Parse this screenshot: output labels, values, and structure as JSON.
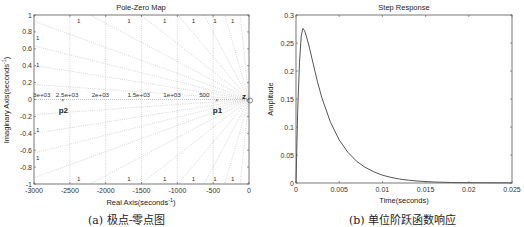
{
  "chart_data": [
    {
      "type": "scatter",
      "title": "Pole-Zero Map",
      "xlabel": "Real Axis(seconds",
      "xlabel_sup": "-1",
      "xlabel_close": ")",
      "ylabel": "Imaginary Axis(seconds",
      "ylabel_sup": "-1",
      "ylabel_close": ")",
      "xlim": [
        -3000,
        0
      ],
      "ylim": [
        -1,
        1
      ],
      "xticks": [
        -3000,
        -2500,
        -2000,
        -1500,
        -1000,
        -500,
        0
      ],
      "yticks": [
        -1,
        -0.8,
        -0.6,
        -0.4,
        -0.2,
        0,
        0.2,
        0.4,
        0.6,
        0.8,
        1
      ],
      "grid": true,
      "grid_freq_labels": [
        "3e+03",
        "2.5e+03",
        "2e+03",
        "1.5e+03",
        "1e+03",
        "500"
      ],
      "damping_label": "1",
      "poles": [
        {
          "label": "p1",
          "real": -450,
          "imag": 0
        },
        {
          "label": "p2",
          "real": -2600,
          "imag": 0
        }
      ],
      "zeros": [
        {
          "label": "z",
          "real": 0,
          "imag": 0
        }
      ],
      "caption": "(a) 极点-零点图"
    },
    {
      "type": "line",
      "title": "Step Response",
      "xlabel": "Time(seconds)",
      "ylabel": "Amplitude",
      "xlim": [
        0,
        0.025
      ],
      "ylim": [
        0,
        0.3
      ],
      "xticks": [
        0,
        0.005,
        0.01,
        0.015,
        0.02,
        0.025
      ],
      "xtick_labels": [
        "0",
        "0.005",
        "0.01",
        "0.015",
        "0.02",
        "0.025"
      ],
      "yticks": [
        0,
        0.05,
        0.1,
        0.15,
        0.2,
        0.25,
        0.3
      ],
      "ytick_labels": [
        "0",
        "0.05",
        "0.1",
        "0.15",
        "0.2",
        "0.25",
        "0.3"
      ],
      "grid": false,
      "series": [
        {
          "name": "step",
          "x": [
            0,
            0.0002,
            0.0004,
            0.0006,
            0.0008,
            0.001,
            0.0012,
            0.0015,
            0.002,
            0.0025,
            0.003,
            0.004,
            0.005,
            0.006,
            0.007,
            0.008,
            0.009,
            0.01,
            0.011,
            0.012,
            0.013,
            0.014,
            0.015,
            0.016,
            0.018,
            0.02,
            0.025
          ],
          "values": [
            0,
            0.13,
            0.215,
            0.262,
            0.276,
            0.272,
            0.262,
            0.245,
            0.212,
            0.18,
            0.152,
            0.108,
            0.077,
            0.055,
            0.039,
            0.028,
            0.02,
            0.014,
            0.01,
            0.007,
            0.005,
            0.0036,
            0.0026,
            0.0018,
            0.0009,
            0.0005,
            0.0001
          ]
        }
      ],
      "caption": "(b) 单位阶跃函数响应"
    }
  ]
}
